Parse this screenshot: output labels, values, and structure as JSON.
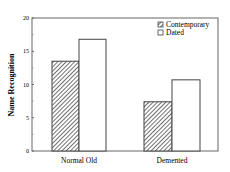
{
  "chart_data": {
    "type": "bar",
    "title": "",
    "xlabel": "",
    "ylabel": "Name Recognition",
    "ylim": [
      0,
      20
    ],
    "yticks": [
      0,
      5,
      10,
      15,
      20
    ],
    "categories": [
      "Normal Old",
      "Demented"
    ],
    "series": [
      {
        "name": "Contemporary",
        "pattern": "hatched",
        "values": [
          13.5,
          7.4
        ]
      },
      {
        "name": "Dated",
        "pattern": "white",
        "values": [
          16.8,
          10.7
        ]
      }
    ],
    "legend_position": "upper right",
    "grid": false
  },
  "colors": {
    "axis": "#555555",
    "bar_stroke": "#444444",
    "hatch": "#333333",
    "fill_white": "#ffffff"
  }
}
